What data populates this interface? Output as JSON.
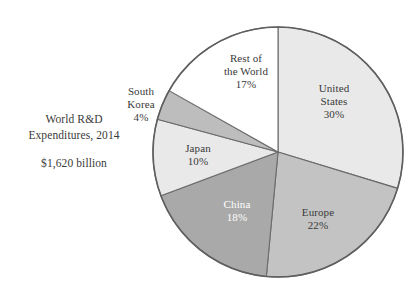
{
  "caption": {
    "line1": "World R&D",
    "line2": "Expenditures, 2014",
    "amount": "$1,620 billion"
  },
  "chart_data": {
    "type": "pie",
    "title": "World R&D Expenditures, 2014",
    "subtitle": "$1,620 billion",
    "total_label": "$1,620 billion",
    "unit": "%",
    "start_angle_deg": 0,
    "direction": "clockwise",
    "legend": "none",
    "grid": false,
    "categories": [
      "United States",
      "Europe",
      "China",
      "Japan",
      "South Korea",
      "Rest of the World"
    ],
    "values": [
      30,
      22,
      18,
      10,
      4,
      17
    ],
    "colors": [
      "#e9e9e9",
      "#c3c3c3",
      "#a9a9a9",
      "#e9e9e9",
      "#bdbdbd",
      "#ffffff"
    ],
    "slices": [
      {
        "name": "United States",
        "value": 30,
        "value_label": "30%",
        "label_lines": [
          "United",
          "States",
          "30%"
        ],
        "color": "#e9e9e9",
        "label_placement": "inside",
        "label_color": "#3a3a3a"
      },
      {
        "name": "Europe",
        "value": 22,
        "value_label": "22%",
        "label_lines": [
          "Europe",
          "22%"
        ],
        "color": "#c3c3c3",
        "label_placement": "inside",
        "label_color": "#3a3a3a"
      },
      {
        "name": "China",
        "value": 18,
        "value_label": "18%",
        "label_lines": [
          "China",
          "18%"
        ],
        "color": "#a9a9a9",
        "label_placement": "inside",
        "label_color": "#ffffff"
      },
      {
        "name": "Japan",
        "value": 10,
        "value_label": "10%",
        "label_lines": [
          "Japan",
          "10%"
        ],
        "color": "#e9e9e9",
        "label_placement": "inside",
        "label_color": "#3a3a3a"
      },
      {
        "name": "South Korea",
        "value": 4,
        "value_label": "4%",
        "label_lines": [
          "South",
          "Korea",
          "4%"
        ],
        "color": "#bdbdbd",
        "label_placement": "outside",
        "label_color": "#3a3a3a"
      },
      {
        "name": "Rest of the World",
        "value": 17,
        "value_label": "17%",
        "label_lines": [
          "Rest of",
          "the World",
          "17%"
        ],
        "color": "#ffffff",
        "label_placement": "inside",
        "label_color": "#3a3a3a"
      }
    ]
  },
  "labels": {
    "united_states": {
      "l1": "United",
      "l2": "States",
      "l3": "30%"
    },
    "europe": {
      "l1": "Europe",
      "l2": "22%"
    },
    "china": {
      "l1": "China",
      "l2": "18%"
    },
    "japan": {
      "l1": "Japan",
      "l2": "10%"
    },
    "south_korea": {
      "l1": "South",
      "l2": "Korea",
      "l3": "4%"
    },
    "rest_of_world": {
      "l1": "Rest of",
      "l2": "the World",
      "l3": "17%"
    }
  }
}
